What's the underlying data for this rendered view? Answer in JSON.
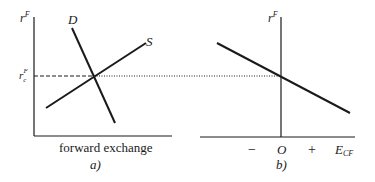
{
  "panel_a": {
    "y_axis_label": "r",
    "y_axis_label_sup": "F",
    "equilibrium_label": "r",
    "equilibrium_label_sub": "c",
    "equilibrium_label_sup": "F",
    "demand_label": "D",
    "supply_label": "S",
    "x_axis_label": "forward exchange",
    "caption": "a)"
  },
  "panel_b": {
    "y_axis_label": "r",
    "y_axis_label_sup": "F",
    "tick_minus": "−",
    "tick_origin": "O",
    "tick_plus": "+",
    "x_axis_label": "E",
    "x_axis_label_sub": "CF",
    "caption": "b)"
  },
  "colors": {
    "line": "#1a1a1a",
    "background": "#ffffff"
  }
}
